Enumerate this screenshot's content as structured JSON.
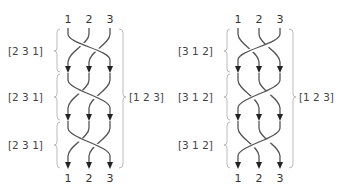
{
  "diagrams": [
    {
      "id": "left",
      "top_labels": [
        "1",
        "2",
        "3"
      ],
      "bottom_labels": [
        "1",
        "2",
        "3"
      ],
      "stage_labels": [
        "[2 3 1]",
        "[2 3 1]",
        "[2 3 1]"
      ],
      "total_label": "[1 2 3]",
      "permutation": [
        2,
        3,
        1
      ],
      "stages": 3
    },
    {
      "id": "right",
      "top_labels": [
        "1",
        "2",
        "3"
      ],
      "bottom_labels": [
        "1",
        "2",
        "3"
      ],
      "stage_labels": [
        "[3 1 2]",
        "[3 1 2]",
        "[3 1 2]"
      ],
      "total_label": "[1 2 3]",
      "permutation": [
        3,
        1,
        2
      ],
      "stages": 3
    }
  ],
  "colors": {
    "strand": "#555555",
    "arrow": "#222222",
    "brace": "#bbbbbb",
    "text": "#444444"
  }
}
